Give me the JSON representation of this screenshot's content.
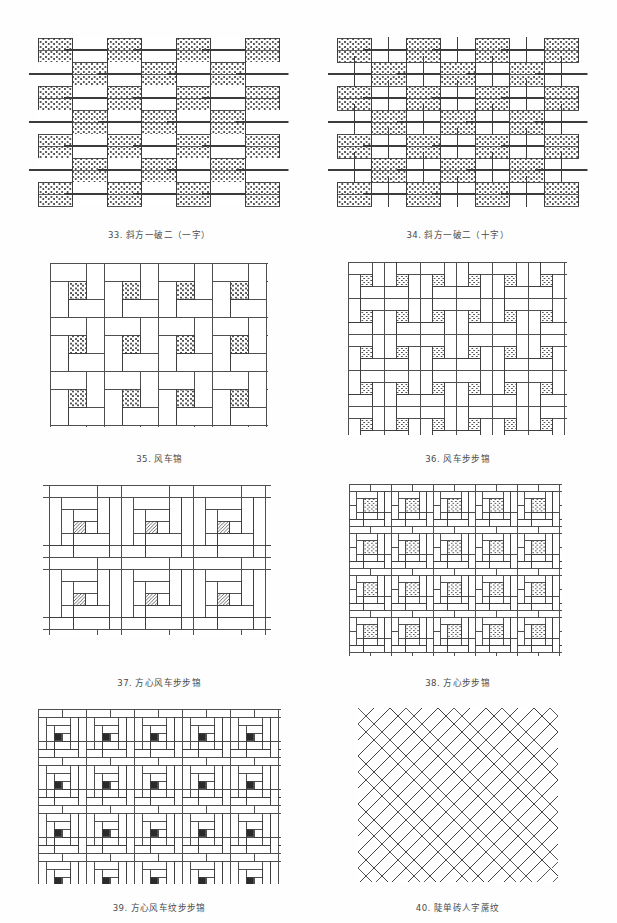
{
  "page": {
    "background_color": "#fefefe",
    "ink_color": "#3c3c3c",
    "hatch_color": "#555555",
    "columns": 2,
    "rows": 4
  },
  "figures": [
    {
      "index": "33",
      "number_label": "33.",
      "name": "斜方一破二（一字）",
      "caption": "33. 斜方一破二（一字）",
      "pattern_type": "checker-offset-bond",
      "fill": "dense-brick-hatch",
      "cols": 7,
      "rows": 7,
      "cell_w": 44,
      "cell_h": 26,
      "width": 245,
      "height": 180
    },
    {
      "index": "34",
      "number_label": "34.",
      "name": "斜方一破二（十字）",
      "caption": "34. 斜方一破二（十字）",
      "pattern_type": "cross-checker-bond",
      "fill": "dense-brick-hatch",
      "cols": 7,
      "rows": 7,
      "cell_w": 44,
      "cell_h": 26,
      "width": 245,
      "height": 180
    },
    {
      "index": "35",
      "number_label": "35.",
      "name": "风车锦",
      "caption": "35. 风车锦",
      "pattern_type": "pinwheel",
      "fill": "hatched-center-square",
      "unit": 54,
      "cols": 4,
      "rows": 3,
      "width": 216,
      "height": 162
    },
    {
      "index": "36",
      "number_label": "36.",
      "name": "风车步步锦",
      "caption": "36. 风车步步锦",
      "pattern_type": "pinwheel-stepped-brocade",
      "fill": "hatched-center-square",
      "unit": 36,
      "cols": 6,
      "rows": 5,
      "width": 216,
      "height": 180
    },
    {
      "index": "37",
      "number_label": "37.",
      "name": "方心风车步步锦",
      "caption": "37. 方心风车步步锦",
      "pattern_type": "square-heart-pinwheel-stepped",
      "fill": "diagonal-hatch-square",
      "unit": 72,
      "cols": 3,
      "rows": 2,
      "width": 216,
      "height": 170
    },
    {
      "index": "38",
      "number_label": "38.",
      "name": "方心步步锦",
      "caption": "38. 方心步步锦",
      "pattern_type": "square-heart-stepped-brocade",
      "fill": "hatched-center-square",
      "unit": 42,
      "cols": 5,
      "rows": 4,
      "width": 210,
      "height": 176
    },
    {
      "index": "39",
      "number_label": "39.",
      "name": "方心风车纹步步锦",
      "caption": "39. 方心风车纹步步锦",
      "pattern_type": "square-heart-pinwheel-dense",
      "fill": "solid-dark-square",
      "unit": 48,
      "cols": 5,
      "rows": 4,
      "width": 240,
      "height": 176
    },
    {
      "index": "40",
      "number_label": "40.",
      "name": "陡单砖人字蓆纹",
      "caption": "40. 陡单砖人字蓆纹",
      "pattern_type": "herringbone",
      "fill": "none",
      "brick_length": 34,
      "brick_width": 11,
      "width": 200,
      "height": 176
    }
  ]
}
